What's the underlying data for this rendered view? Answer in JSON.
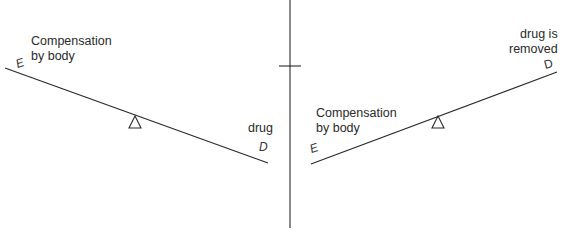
{
  "diagram": {
    "left_panel": {
      "top_label_line1": "Compensation",
      "top_label_line2": "by body",
      "end_left_letter": "E",
      "end_right_label": "drug",
      "end_right_letter": "D"
    },
    "right_panel": {
      "left_label_line1": "Compensation",
      "left_label_line2": "by body",
      "end_left_letter": "E",
      "end_right_label_line1": "drug is",
      "end_right_label_line2": "removed",
      "end_right_letter": "D"
    },
    "colors": {
      "line": "#2a2a2a",
      "background": "#ffffff"
    }
  }
}
